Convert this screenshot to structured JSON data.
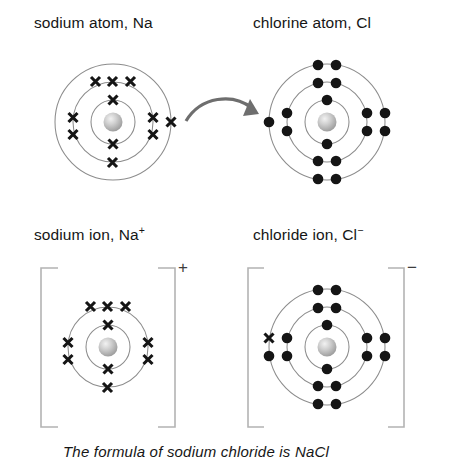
{
  "diagram": {
    "title_semantics": "ionic-bonding-sodium-chloride",
    "background_color": "#ffffff",
    "shell_stroke_color": "#8c8c8c",
    "electron_color": "#151515",
    "nucleus_color": "#b8b8b8",
    "arrow_color": "#6e6e6e",
    "bracket_color": "#b3b3b3"
  },
  "panels": {
    "sodium_atom": {
      "label": "sodium atom, Na",
      "element_symbol": "Na",
      "shell_counts": [
        2,
        8,
        1
      ],
      "electron_glyph": "cross",
      "shell_radii": [
        22,
        40,
        58
      ]
    },
    "chlorine_atom": {
      "label": "chlorine atom, Cl",
      "element_symbol": "Cl",
      "shell_counts": [
        2,
        8,
        7
      ],
      "electron_glyph": "dot",
      "shell_radii": [
        22,
        40,
        58
      ]
    },
    "sodium_ion": {
      "label": "sodium ion, Na",
      "charge": "+",
      "shell_counts": [
        2,
        8
      ],
      "electron_glyph": "cross",
      "shell_radii": [
        22,
        40
      ]
    },
    "chloride_ion": {
      "label": "chloride ion, Cl",
      "charge": "−",
      "shell_counts": [
        2,
        8,
        8
      ],
      "electron_glyph": "dot",
      "transferred_electron_glyph": "cross",
      "shell_radii": [
        22,
        40,
        58
      ]
    }
  },
  "arrow": {
    "name": "electron-transfer-arrow",
    "from": "sodium outer shell electron",
    "to": "chlorine outer shell"
  },
  "caption": {
    "text": "The formula of sodium chloride is NaCl"
  }
}
